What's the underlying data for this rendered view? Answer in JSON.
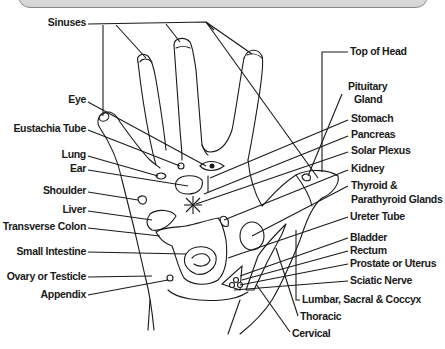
{
  "diagram": {
    "type": "reflexology-hand-chart",
    "left_labels": [
      {
        "id": "sinuses",
        "text": "Sinuses",
        "x": 86,
        "y": 26
      },
      {
        "id": "eye",
        "text": "Eye",
        "x": 86,
        "y": 103
      },
      {
        "id": "eustachia-tube",
        "text": "Eustachia Tube",
        "x": 86,
        "y": 132
      },
      {
        "id": "lung",
        "text": "Lung",
        "x": 86,
        "y": 158
      },
      {
        "id": "ear",
        "text": "Ear",
        "x": 86,
        "y": 172
      },
      {
        "id": "shoulder",
        "text": "Shoulder",
        "x": 86,
        "y": 194
      },
      {
        "id": "liver",
        "text": "Liver",
        "x": 86,
        "y": 213
      },
      {
        "id": "transverse-colon",
        "text": "Transverse Colon",
        "x": 86,
        "y": 230
      },
      {
        "id": "small-intestine",
        "text": "Small Intestine",
        "x": 86,
        "y": 255
      },
      {
        "id": "ovary-or-testicle",
        "text": "Ovary or Testicle",
        "x": 86,
        "y": 280
      },
      {
        "id": "appendix",
        "text": "Appendix",
        "x": 86,
        "y": 298
      }
    ],
    "right_labels": [
      {
        "id": "top-of-head",
        "text": "Top of Head",
        "x": 350,
        "y": 55
      },
      {
        "id": "pituitary-gland-1",
        "text": "Pituitary",
        "x": 348,
        "y": 90
      },
      {
        "id": "pituitary-gland-2",
        "text": "Gland",
        "x": 354,
        "y": 103
      },
      {
        "id": "stomach",
        "text": "Stomach",
        "x": 351,
        "y": 122
      },
      {
        "id": "pancreas",
        "text": "Pancreas",
        "x": 351,
        "y": 138
      },
      {
        "id": "solar-plexus",
        "text": "Solar Plexus",
        "x": 351,
        "y": 154
      },
      {
        "id": "kidney",
        "text": "Kidney",
        "x": 351,
        "y": 172
      },
      {
        "id": "thyroid-1",
        "text": "Thyroid &",
        "x": 351,
        "y": 189
      },
      {
        "id": "thyroid-2",
        "text": "Parathyroid Glands",
        "x": 351,
        "y": 203
      },
      {
        "id": "ureter-tube",
        "text": "Ureter Tube",
        "x": 350,
        "y": 220
      },
      {
        "id": "bladder",
        "text": "Bladder",
        "x": 350,
        "y": 241
      },
      {
        "id": "rectum",
        "text": "Rectum",
        "x": 350,
        "y": 254
      },
      {
        "id": "prostate-or-uterus",
        "text": "Prostate or Uterus",
        "x": 350,
        "y": 267
      },
      {
        "id": "sciatic-nerve",
        "text": "Sciatic Nerve",
        "x": 350,
        "y": 284
      },
      {
        "id": "lumbar-sacral-coccyx",
        "text": "Lumbar, Sacral & Coccyx",
        "x": 302,
        "y": 303
      },
      {
        "id": "thoracic",
        "text": "Thoracic",
        "x": 300,
        "y": 320
      },
      {
        "id": "cervical",
        "text": "Cervical",
        "x": 292,
        "y": 337
      }
    ]
  }
}
